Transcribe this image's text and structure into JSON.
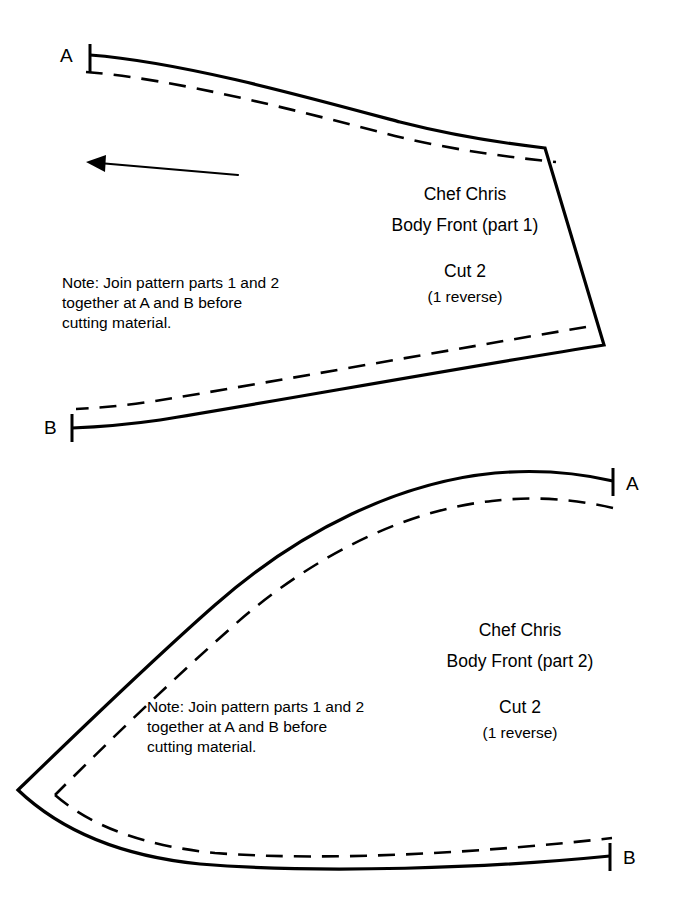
{
  "document": {
    "type": "sewing-pattern-sheet",
    "background_color": "#ffffff",
    "line_color": "#000000"
  },
  "parts": [
    {
      "id": "part-1",
      "title_line_1": "Chef Chris",
      "title_line_2": "Body Front (part 1)",
      "cut_label": "Cut 2",
      "cut_sub_label": "(1 reverse)",
      "note_line_1": "Note: Join pattern parts 1 and 2",
      "note_line_2": "together at A and B before",
      "note_line_3": "cutting material.",
      "marker_top": "A",
      "marker_bottom": "B",
      "has_grainline": true
    },
    {
      "id": "part-2",
      "title_line_1": "Chef Chris",
      "title_line_2": "Body Front (part 2)",
      "cut_label": "Cut 2",
      "cut_sub_label": "(1 reverse)",
      "note_line_1": "Note: Join pattern parts 1 and 2",
      "note_line_2": "together at A and B before",
      "note_line_3": "cutting material.",
      "marker_top": "A",
      "marker_bottom": "B",
      "has_grainline": false
    }
  ]
}
